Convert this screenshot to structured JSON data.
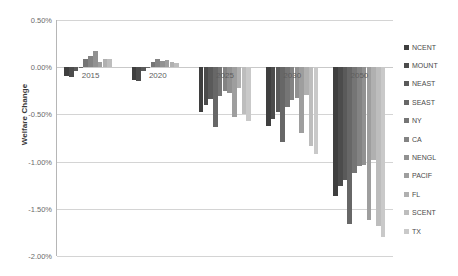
{
  "chart_data": {
    "type": "bar",
    "title": "",
    "xlabel": "",
    "ylabel": "Welfare Change",
    "categories": [
      "2015",
      "2020",
      "2025",
      "2030",
      "2050"
    ],
    "ylim": [
      -2.0,
      0.5
    ],
    "ytick_labels": [
      "0.50%",
      "0.00%",
      "-0.50%",
      "-1.00%",
      "-1.50%",
      "-2.00%"
    ],
    "ytick_values": [
      0.5,
      0.0,
      -0.5,
      -1.0,
      -1.5,
      -2.0
    ],
    "value_suffix": "%",
    "grid": true,
    "legend_position": "right",
    "series": [
      {
        "name": "NCENT",
        "color": "#3f3f3f",
        "values": [
          -0.09,
          -0.14,
          -0.47,
          -0.62,
          -1.36
        ]
      },
      {
        "name": "MOUNT",
        "color": "#4c4c4c",
        "values": [
          -0.1,
          -0.15,
          -0.4,
          -0.55,
          -1.26
        ]
      },
      {
        "name": "NEAST",
        "color": "#5a5a5a",
        "values": [
          -0.04,
          -0.04,
          -0.34,
          -0.47,
          -1.2
        ]
      },
      {
        "name": "SEAST",
        "color": "#676767",
        "values": [
          0.0,
          0.0,
          -0.63,
          -0.79,
          -1.66
        ]
      },
      {
        "name": "NY",
        "color": "#757575",
        "values": [
          0.09,
          0.05,
          -0.3,
          -0.42,
          -1.12
        ]
      },
      {
        "name": "CA",
        "color": "#838383",
        "values": [
          0.12,
          0.09,
          -0.25,
          -0.35,
          -1.05
        ]
      },
      {
        "name": "NENGL",
        "color": "#919191",
        "values": [
          0.17,
          0.07,
          -0.27,
          -0.33,
          -1.04
        ]
      },
      {
        "name": "PACIF",
        "color": "#9e9e9e",
        "values": [
          0.06,
          0.08,
          -0.53,
          -0.7,
          -1.62
        ]
      },
      {
        "name": "FL",
        "color": "#b0b0b0",
        "values": [
          0.09,
          0.05,
          -0.22,
          -0.29,
          -0.98
        ]
      },
      {
        "name": "SCENT",
        "color": "#bdbdbd",
        "values": [
          0.09,
          0.04,
          -0.5,
          -0.84,
          -1.68
        ]
      },
      {
        "name": "TX",
        "color": "#c9c9c9",
        "values": [
          0.0,
          0.0,
          -0.57,
          -0.92,
          -1.8
        ]
      }
    ]
  },
  "legend": {
    "items": [
      "NCENT",
      "MOUNT",
      "NEAST",
      "SEAST",
      "NY",
      "CA",
      "NENGL",
      "PACIF",
      "FL",
      "SCENT",
      "TX"
    ]
  }
}
